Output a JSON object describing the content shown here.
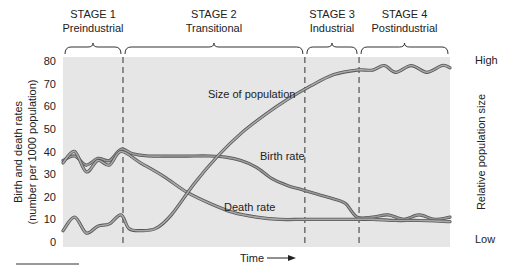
{
  "chart_data": {
    "type": "line",
    "title": "",
    "xlabel": "Time",
    "ylabel": "Birth and death rates",
    "ylabel_sub": "(number per 1000 population)",
    "y2label": "Relative population size",
    "y2_high": "High",
    "y2_low": "Low",
    "ylim": [
      0,
      80
    ],
    "yticks": [
      "0",
      "10",
      "20",
      "30",
      "40",
      "50",
      "60",
      "70",
      "80"
    ],
    "xlim": [
      0,
      100
    ],
    "stages": [
      {
        "title": "STAGE 1",
        "name": "Preindustrial",
        "start": 0,
        "end": 15.5
      },
      {
        "title": "STAGE 2",
        "name": "Transitional",
        "start": 15.5,
        "end": 62.5
      },
      {
        "title": "STAGE 3",
        "name": "Industrial",
        "start": 62.5,
        "end": 76.5
      },
      {
        "title": "STAGE 4",
        "name": "Postindustrial",
        "start": 76.5,
        "end": 100
      }
    ],
    "series": [
      {
        "name": "Birth rate",
        "label": "Birth rate",
        "color": "#7a7a7a",
        "x": [
          0,
          3,
          6,
          9,
          12,
          15,
          18,
          22,
          26,
          32,
          38,
          42,
          46,
          50,
          54,
          58,
          62,
          66,
          70,
          73,
          76,
          80,
          84,
          88,
          92,
          96,
          100
        ],
        "y": [
          36,
          38,
          34,
          37,
          36,
          41,
          39,
          38,
          38,
          38,
          38,
          37.5,
          36,
          33,
          28,
          25,
          23,
          21,
          19,
          17,
          11,
          11,
          12,
          10,
          12,
          10,
          11
        ]
      },
      {
        "name": "Death rate",
        "label": "Death rate",
        "color": "#8a8a8a",
        "x": [
          0,
          3,
          6,
          9,
          12,
          15,
          20,
          26,
          32,
          38,
          44,
          50,
          56,
          62,
          68,
          74,
          80,
          86,
          92,
          100
        ],
        "y": [
          35,
          40,
          31,
          36,
          34,
          40,
          35,
          29,
          22,
          17,
          13,
          11,
          10,
          10,
          10,
          10,
          10,
          9.5,
          9.5,
          9
        ]
      },
      {
        "name": "Size of population",
        "label": "Size of population",
        "color": "#8c8c8c",
        "axis": "relative",
        "x": [
          0,
          3,
          6,
          9,
          12,
          15,
          17,
          20,
          24,
          28,
          34,
          40,
          46,
          52,
          58,
          64,
          70,
          76,
          80,
          83,
          86,
          90,
          94,
          98,
          100
        ],
        "y": [
          5,
          11,
          4,
          7,
          8,
          12,
          6,
          5,
          6,
          12,
          26,
          38,
          48,
          56,
          63,
          69,
          74,
          76,
          76,
          78,
          75,
          78,
          75,
          78,
          77
        ]
      }
    ],
    "grid": false,
    "legend": "inline-labels"
  }
}
